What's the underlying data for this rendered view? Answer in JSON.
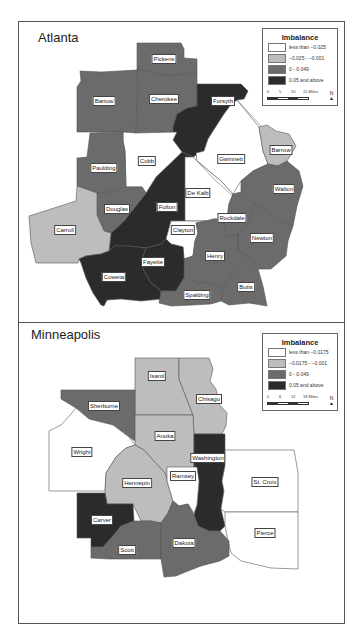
{
  "colors": {
    "class1": "#ffffff",
    "class2": "#bdbdbd",
    "class3": "#6b6b6b",
    "class4": "#2b2b2b",
    "border": "#555555"
  },
  "atlanta": {
    "title": "Atlanta",
    "legend": {
      "title": "Imbalance",
      "items": [
        {
          "label": "less than −0.025",
          "color": "#ffffff"
        },
        {
          "label": "−0.025 - −0.001",
          "color": "#bdbdbd"
        },
        {
          "label": "0 - 0.049",
          "color": "#6b6b6b"
        },
        {
          "label": "0.05 and above",
          "color": "#2b2b2b"
        }
      ],
      "scale": {
        "ticks": [
          "0",
          "5",
          "10",
          "15 Miles"
        ]
      },
      "north": "N"
    },
    "counties": [
      {
        "name": "Pickens",
        "class": 3
      },
      {
        "name": "Bartow",
        "class": 3
      },
      {
        "name": "Cherokee",
        "class": 3
      },
      {
        "name": "Forsyth",
        "class": 4
      },
      {
        "name": "Cobb",
        "class": 1
      },
      {
        "name": "Paulding",
        "class": 3
      },
      {
        "name": "Gwinnett",
        "class": 1
      },
      {
        "name": "Barrow",
        "class": 2
      },
      {
        "name": "Douglas",
        "class": 3
      },
      {
        "name": "Fulton",
        "class": 4
      },
      {
        "name": "De Kalb",
        "class": 1
      },
      {
        "name": "Walton",
        "class": 3
      },
      {
        "name": "Carroll",
        "class": 2
      },
      {
        "name": "Rockdale",
        "class": 3
      },
      {
        "name": "Clayton",
        "class": 1
      },
      {
        "name": "Newton",
        "class": 3
      },
      {
        "name": "Henry",
        "class": 3
      },
      {
        "name": "Fayette",
        "class": 4
      },
      {
        "name": "Coweta",
        "class": 4
      },
      {
        "name": "Spalding",
        "class": 3
      },
      {
        "name": "Butts",
        "class": 3
      }
    ]
  },
  "minneapolis": {
    "title": "Minneapolis",
    "legend": {
      "title": "Imbalance",
      "items": [
        {
          "label": "less than −0.0175",
          "color": "#ffffff"
        },
        {
          "label": "−0.0175 - −0.001",
          "color": "#bdbdbd"
        },
        {
          "label": "0 - 0.049",
          "color": "#6b6b6b"
        },
        {
          "label": "0.05 and above",
          "color": "#2b2b2b"
        }
      ],
      "scale": {
        "ticks": [
          "0",
          "6",
          "12",
          "18 Miles"
        ]
      },
      "north": "N"
    },
    "counties": [
      {
        "name": "Isanti",
        "class": 2
      },
      {
        "name": "Chisago",
        "class": 2
      },
      {
        "name": "Sherburne",
        "class": 3
      },
      {
        "name": "Anoka",
        "class": 2
      },
      {
        "name": "Wright",
        "class": 1
      },
      {
        "name": "Washington",
        "class": 4
      },
      {
        "name": "Hennepin",
        "class": 2
      },
      {
        "name": "Ramsey",
        "class": 1
      },
      {
        "name": "St. Croix",
        "class": 1
      },
      {
        "name": "Carver",
        "class": 4
      },
      {
        "name": "Pierce",
        "class": 1
      },
      {
        "name": "Scott",
        "class": 3
      },
      {
        "name": "Dakota",
        "class": 3
      }
    ]
  }
}
